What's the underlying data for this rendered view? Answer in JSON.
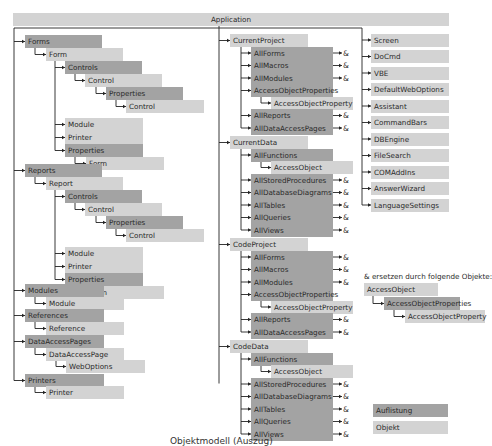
{
  "colors": {
    "collection": "#a3a3a3",
    "object": "#d3d3d3",
    "line": "#222222"
  },
  "root": "Application",
  "col1": {
    "forms": "Forms",
    "form": "Form",
    "controls": "Controls",
    "control": "Control",
    "properties": "Properties",
    "module": "Module",
    "printer": "Printer",
    "reports": "Reports",
    "report": "Report",
    "modules": "Modules",
    "references": "References",
    "reference": "Reference",
    "dataAccessPages": "DataAccessPages",
    "dataAccessPage": "DataAccessPage",
    "webOptions": "WebOptions",
    "printers": "Printers"
  },
  "col2": {
    "currentProject": "CurrentProject",
    "currentData": "CurrentData",
    "codeProject": "CodeProject",
    "codeData": "CodeData",
    "allForms": "AllForms",
    "allMacros": "AllMacros",
    "allModules": "AllModules",
    "accessObjectProperties": "AccessObjectProperties",
    "accessObjectProperty": "AccessObjectProperty",
    "allReports": "AllReports",
    "allDataAccessPages": "AllDataAccessPages",
    "allFunctions": "AllFunctions",
    "accessObject": "AccessObject",
    "allStoredProcedures": "AllStoredProcedures",
    "allDatabaseDiagrams": "AllDatabaseDiagrams",
    "allTables": "AllTables",
    "allQueries": "AllQueries",
    "allViews": "AllViews",
    "amp": "&"
  },
  "col3": [
    "Screen",
    "DoCmd",
    "VBE",
    "DefaultWebOptions",
    "Assistant",
    "CommandBars",
    "DBEngine",
    "FileSearch",
    "COMAddIns",
    "AnswerWizard",
    "LanguageSettings"
  ],
  "replacement": {
    "note": "& ersetzen durch folgende Objekte:",
    "accessObject": "AccessObject",
    "accessObjectProperties": "AccessObjectProperties",
    "accessObjectProperty": "AccessObjectProperty"
  },
  "legend": {
    "collection": "Auflistung",
    "object": "Objekt"
  },
  "caption": "Objektmodell (Auszug)"
}
